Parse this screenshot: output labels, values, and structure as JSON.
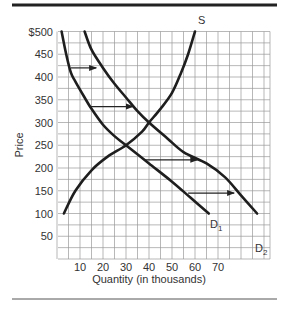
{
  "chart_data": {
    "type": "line",
    "title": "",
    "xlabel": "Quantity (in thousands)",
    "ylabel": "Price",
    "xlim": [
      0,
      93
    ],
    "ylim": [
      0,
      500
    ],
    "x_ticks": [
      10,
      20,
      30,
      40,
      50,
      60,
      70
    ],
    "y_ticks": [
      "$500",
      "450",
      "400",
      "350",
      "300",
      "250",
      "200",
      "150",
      "100",
      "50"
    ],
    "y_tick_values": [
      500,
      450,
      400,
      350,
      300,
      250,
      200,
      150,
      100,
      50
    ],
    "grid": true,
    "grid_minor_x_step": 5,
    "grid_minor_y_step": 25,
    "legend": null,
    "series": [
      {
        "name": "S",
        "label": "S",
        "points": [
          [
            3,
            100
          ],
          [
            8,
            150
          ],
          [
            15,
            195
          ],
          [
            22,
            225
          ],
          [
            30,
            250
          ],
          [
            37,
            280
          ],
          [
            40,
            300
          ],
          [
            45,
            330
          ],
          [
            50,
            365
          ],
          [
            54,
            410
          ],
          [
            57,
            450
          ],
          [
            60,
            500
          ]
        ]
      },
      {
        "name": "D1",
        "label": "D",
        "subscript": "1",
        "points": [
          [
            2,
            500
          ],
          [
            4,
            450
          ],
          [
            6,
            410
          ],
          [
            8,
            390
          ],
          [
            12,
            355
          ],
          [
            15,
            330
          ],
          [
            20,
            295
          ],
          [
            25,
            270
          ],
          [
            30,
            250
          ],
          [
            40,
            210
          ],
          [
            50,
            170
          ],
          [
            58,
            135
          ],
          [
            66,
            100
          ]
        ]
      },
      {
        "name": "D2",
        "label": "D",
        "subscript": "2",
        "points": [
          [
            12,
            500
          ],
          [
            15,
            460
          ],
          [
            20,
            420
          ],
          [
            25,
            385
          ],
          [
            30,
            355
          ],
          [
            35,
            325
          ],
          [
            40,
            300
          ],
          [
            48,
            265
          ],
          [
            55,
            235
          ],
          [
            65,
            210
          ],
          [
            73,
            180
          ],
          [
            80,
            140
          ],
          [
            87,
            100
          ]
        ]
      }
    ],
    "annotations": [
      {
        "type": "arrow",
        "from": [
          6,
          420
        ],
        "to": [
          17,
          420
        ],
        "note": "demand shift right"
      },
      {
        "type": "arrow",
        "from": [
          14,
          335
        ],
        "to": [
          33,
          335
        ],
        "note": "demand shift right"
      },
      {
        "type": "arrow",
        "from": [
          38,
          218
        ],
        "to": [
          61,
          218
        ],
        "note": "demand shift right"
      },
      {
        "type": "arrow",
        "from": [
          57,
          145
        ],
        "to": [
          77,
          145
        ],
        "note": "demand shift right"
      }
    ],
    "intersections": [
      {
        "curves": [
          "S",
          "D1"
        ],
        "point": [
          30,
          250
        ]
      },
      {
        "curves": [
          "S",
          "D2"
        ],
        "point": [
          40,
          300
        ]
      }
    ]
  }
}
